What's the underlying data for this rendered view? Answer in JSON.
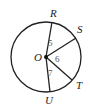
{
  "diagram": {
    "type": "circle-with-radii",
    "colors": {
      "stroke": "#222222",
      "angle_label": "#555555",
      "background": "#ffffff"
    },
    "circle": {
      "cx": 46,
      "cy": 57,
      "r": 35
    },
    "center": {
      "label": "O",
      "x": 46,
      "y": 57
    },
    "points": [
      {
        "label": "R",
        "x": 52,
        "y": 22,
        "label_x": 50,
        "label_y": 17
      },
      {
        "label": "S",
        "x": 76,
        "y": 38,
        "label_x": 77,
        "label_y": 33
      },
      {
        "label": "T",
        "x": 72,
        "y": 80,
        "label_x": 76,
        "label_y": 89
      },
      {
        "label": "U",
        "x": 50,
        "y": 92,
        "label_x": 45,
        "label_y": 104
      }
    ],
    "angles": [
      {
        "label": "5",
        "between": [
          "R",
          "S"
        ],
        "x": 48,
        "y": 46
      },
      {
        "label": "6",
        "between": [
          "S",
          "T"
        ],
        "x": 55,
        "y": 62
      },
      {
        "label": "7",
        "between": [
          "T",
          "U"
        ],
        "x": 48,
        "y": 76
      }
    ]
  }
}
